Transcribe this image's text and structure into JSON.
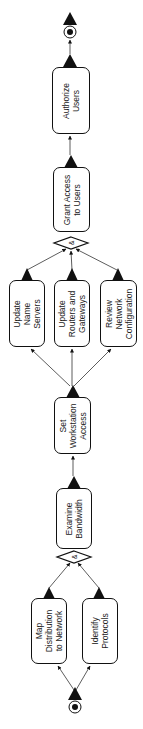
{
  "diagram": {
    "type": "activity-flowchart",
    "orientation": "bottom-to-top (rotated 90°)",
    "colors": {
      "stroke": "#111111",
      "fill": "#ffffff",
      "text": "#222222"
    },
    "start_node": {
      "label": "start"
    },
    "end_node": {
      "label": "end"
    },
    "nodes": [
      {
        "id": "map",
        "label": "Map\nDistribution\nto Network",
        "x": 31,
        "y": 598,
        "w": 36,
        "h": 66
      },
      {
        "id": "identify",
        "label": "Identify\nProtocols",
        "x": 82,
        "y": 598,
        "w": 36,
        "h": 66
      },
      {
        "id": "examine",
        "label": "Examine\nBandwidth",
        "x": 56,
        "y": 488,
        "w": 36,
        "h": 61
      },
      {
        "id": "workstation",
        "label": "Set\nWorkstation\nAccess",
        "x": 54,
        "y": 397,
        "w": 37,
        "h": 57
      },
      {
        "id": "nameservers",
        "label": "Update\nName\nServers",
        "x": 9,
        "y": 280,
        "w": 36,
        "h": 67
      },
      {
        "id": "routers",
        "label": "Update\nRouters and\nGateways",
        "x": 54,
        "y": 280,
        "w": 36,
        "h": 67
      },
      {
        "id": "review",
        "label": "Review\nNetwork\nConfiguration",
        "x": 100,
        "y": 280,
        "w": 37,
        "h": 67
      },
      {
        "id": "grant",
        "label": "Grant Access\nto Users",
        "x": 53,
        "y": 167,
        "w": 37,
        "h": 65
      },
      {
        "id": "authorize",
        "label": "Authorize\nUsers",
        "x": 52,
        "y": 67,
        "w": 38,
        "h": 67
      }
    ],
    "joins": [
      {
        "id": "join1",
        "symbol": "&",
        "cx": 74,
        "cy": 557
      },
      {
        "id": "join2",
        "symbol": "&",
        "cx": 71,
        "cy": 243
      }
    ],
    "edges": [
      {
        "from": "start",
        "to": "map"
      },
      {
        "from": "start",
        "to": "identify"
      },
      {
        "from": "map",
        "to": "join1"
      },
      {
        "from": "identify",
        "to": "join1"
      },
      {
        "from": "join1",
        "to": "examine"
      },
      {
        "from": "examine",
        "to": "workstation"
      },
      {
        "from": "workstation",
        "to": "nameservers"
      },
      {
        "from": "workstation",
        "to": "routers"
      },
      {
        "from": "workstation",
        "to": "review"
      },
      {
        "from": "nameservers",
        "to": "join2"
      },
      {
        "from": "routers",
        "to": "join2"
      },
      {
        "from": "review",
        "to": "join2"
      },
      {
        "from": "join2",
        "to": "grant"
      },
      {
        "from": "grant",
        "to": "authorize"
      },
      {
        "from": "authorize",
        "to": "end"
      }
    ]
  },
  "labels": {
    "map": "Map\nDistribution\nto Network",
    "identify": "Identify\nProtocols",
    "examine": "Examine\nBandwidth",
    "workstation": "Set\nWorkstation\nAccess",
    "nameservers": "Update\nName\nServers",
    "routers": "Update\nRouters and\nGateways",
    "review": "Review\nNetwork\nConfiguration",
    "grant": "Grant Access\nto Users",
    "authorize": "Authorize\nUsers",
    "join_symbol": "&"
  }
}
